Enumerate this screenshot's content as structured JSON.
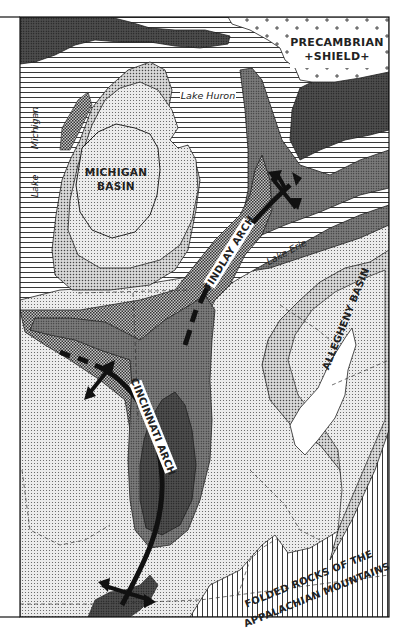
{
  "map": {
    "colors": {
      "paper": "#ffffff",
      "ink": "#1e1e1e",
      "light_stipple": "#d8d8d8",
      "medium_stipple": "#bdbdbd",
      "checker": "#9a9a9a",
      "dark": "#6e6e6e",
      "darkest": "#4a4a4a",
      "water_lines": "#1e1e1e"
    },
    "labels": {
      "precambrian": "PRECAMBRIAN",
      "shield": "+SHIELD+",
      "lake_huron": "Lake Huron",
      "lake_michigan_1": "Lake",
      "lake_michigan_2": "Michigan",
      "michigan_basin_1": "MICHIGAN",
      "michigan_basin_2": "BASIN",
      "findlay_arch": "FINDLAY ARCH",
      "lake_erie": "Lake Erie",
      "allegheny_basin": "ALLEGHENY BASIN",
      "cincinnati_arch": "CINCINNATI ARCH",
      "folded_rocks_1": "FOLDED ROCKS OF THE",
      "folded_rocks_2": "APPALACHIAN MOUNTAINS"
    },
    "features": [
      {
        "name": "Precambrian Shield",
        "type": "geologic-province",
        "pattern": "crosses"
      },
      {
        "name": "Michigan Basin",
        "type": "basin"
      },
      {
        "name": "Findlay Arch",
        "type": "anticline-arch"
      },
      {
        "name": "Cincinnati Arch",
        "type": "anticline-arch"
      },
      {
        "name": "Allegheny Basin",
        "type": "basin"
      },
      {
        "name": "Folded Rocks of the Appalachian Mountains",
        "type": "fold-belt",
        "pattern": "vertical-lines"
      },
      {
        "name": "Lake Huron",
        "type": "lake"
      },
      {
        "name": "Lake Michigan",
        "type": "lake"
      },
      {
        "name": "Lake Erie",
        "type": "lake"
      }
    ]
  }
}
